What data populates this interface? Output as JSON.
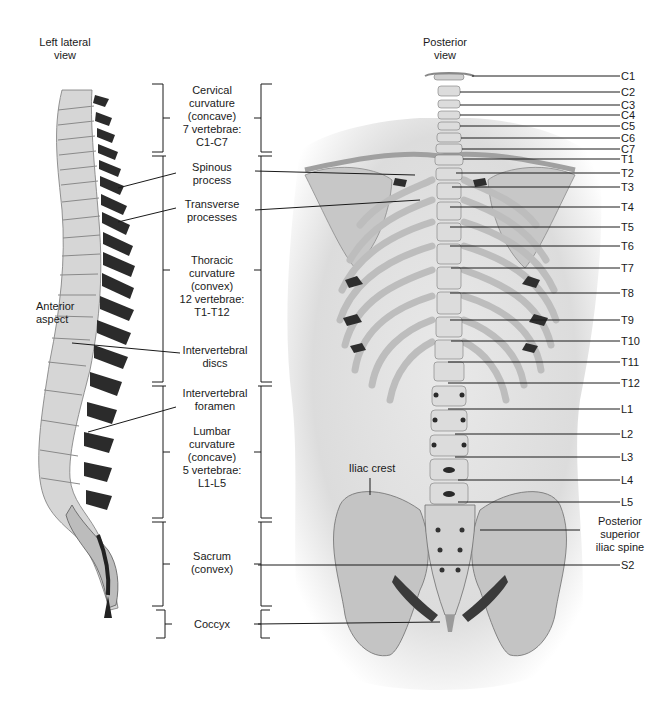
{
  "views": {
    "lateral_title": "Left lateral\nview",
    "posterior_title": "Posterior\nview"
  },
  "lateral_labels": {
    "anterior_aspect": "Anterior\naspect"
  },
  "regions": [
    {
      "id": "cervical",
      "text": "Cervical\ncurvature\n(concave)\n7 vertebrae:\nC1-C7"
    },
    {
      "id": "thoracic",
      "text": "Thoracic\ncurvature\n(convex)\n12 vertebrae:\nT1-T12"
    },
    {
      "id": "lumbar",
      "text": "Lumbar\ncurvature\n(concave)\n5 vertebrae:\nL1-L5"
    },
    {
      "id": "sacrum",
      "text": "Sacrum\n(convex)"
    },
    {
      "id": "coccyx",
      "text": "Coccyx"
    }
  ],
  "structures": [
    {
      "id": "spinous",
      "text": "Spinous\nprocess"
    },
    {
      "id": "transverse",
      "text": "Transverse\nprocesses"
    },
    {
      "id": "discs",
      "text": "Intervertebral\ndiscs"
    },
    {
      "id": "foramen",
      "text": "Intervertebral\nforamen"
    }
  ],
  "posterior_labels": {
    "iliac_crest": "Iliac crest",
    "psis": "Posterior\nsuperior\niliac spine"
  },
  "vertebrae": [
    {
      "label": "C1",
      "y": 76
    },
    {
      "label": "C2",
      "y": 92
    },
    {
      "label": "C3",
      "y": 105
    },
    {
      "label": "C4",
      "y": 115
    },
    {
      "label": "C5",
      "y": 126
    },
    {
      "label": "C6",
      "y": 138
    },
    {
      "label": "C7",
      "y": 149
    },
    {
      "label": "T1",
      "y": 159
    },
    {
      "label": "T2",
      "y": 173
    },
    {
      "label": "T3",
      "y": 187
    },
    {
      "label": "T4",
      "y": 207
    },
    {
      "label": "T5",
      "y": 227
    },
    {
      "label": "T6",
      "y": 246
    },
    {
      "label": "T7",
      "y": 268
    },
    {
      "label": "T8",
      "y": 293
    },
    {
      "label": "T9",
      "y": 320
    },
    {
      "label": "T10",
      "y": 341
    },
    {
      "label": "T11",
      "y": 362
    },
    {
      "label": "T12",
      "y": 383
    },
    {
      "label": "L1",
      "y": 409
    },
    {
      "label": "L2",
      "y": 434
    },
    {
      "label": "L3",
      "y": 457
    },
    {
      "label": "L4",
      "y": 480
    },
    {
      "label": "L5",
      "y": 502
    },
    {
      "label": "S2",
      "y": 565
    }
  ]
}
